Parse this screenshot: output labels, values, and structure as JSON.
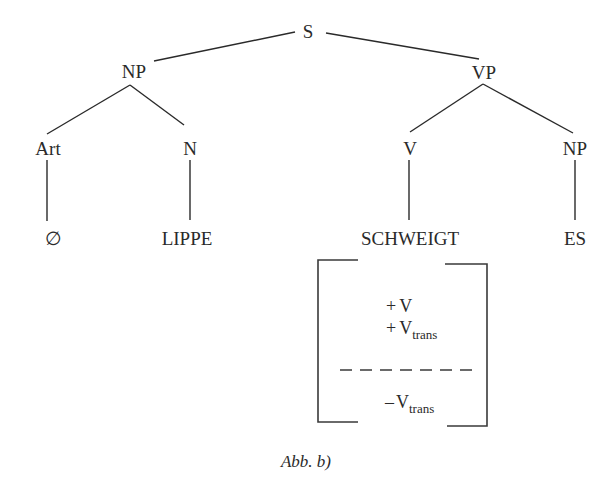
{
  "tree": {
    "root": {
      "label": "S"
    },
    "np_subject": {
      "label": "NP"
    },
    "vp": {
      "label": "VP"
    },
    "art": {
      "label": "Art"
    },
    "n": {
      "label": "N"
    },
    "v": {
      "label": "V"
    },
    "np_object": {
      "label": "NP"
    },
    "leaves": {
      "art_leaf": "∅",
      "n_leaf": "LIPPE",
      "v_leaf": "SCHWEIGT",
      "np_leaf": "ES"
    }
  },
  "feature_matrix": {
    "upper": [
      {
        "sign": "+",
        "symbol": "V",
        "subscript": ""
      },
      {
        "sign": "+",
        "symbol": "V",
        "subscript": "trans"
      }
    ],
    "lower": [
      {
        "sign": "–",
        "symbol": "V",
        "subscript": "trans"
      }
    ]
  },
  "caption": "Abb. b)"
}
